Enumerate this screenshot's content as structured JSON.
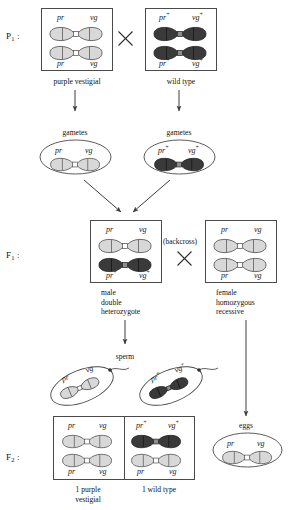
{
  "figure": {
    "colors": {
      "chromosome_recessive": "#d8d8d8",
      "chromosome_wildtype": "#3a3a3a",
      "outline": "#4a4a4a",
      "text": "#111111",
      "background": "#ffffff"
    }
  },
  "generations": {
    "p1_label": "P",
    "p1_sub": "1",
    "p1_colon": " :",
    "f1_label": "F",
    "f1_sub": "1",
    "f1_colon": " :",
    "f2_label": "F",
    "f2_sub": "2",
    "f2_colon": " :"
  },
  "alleles": {
    "pr": "pr",
    "vg": "vg",
    "pr_plus_base": "pr",
    "vg_plus_base": "vg",
    "plus": "+"
  },
  "p1": {
    "parent_left": {
      "caption": "purple vestigial",
      "top_left_allele": "pr",
      "top_right_allele": "vg",
      "bottom_left_allele": "pr",
      "bottom_right_allele": "vg",
      "chromosome_type": "recessive"
    },
    "parent_right": {
      "caption": "wild type",
      "top_left_allele": "pr",
      "top_right_allele": "vg",
      "bottom_left_allele": "pr",
      "bottom_right_allele": "vg",
      "chromosome_type": "wildtype"
    },
    "cross_symbol": "×"
  },
  "gametes": {
    "left_label": "gametes",
    "right_label": "gametes",
    "left_alleles": {
      "left": "pr",
      "right": "vg"
    },
    "right_alleles": {
      "left": "pr",
      "right": "vg"
    }
  },
  "f1": {
    "male": {
      "caption_line1": "male",
      "caption_line2": "double",
      "caption_line3": "heterozygote",
      "top_left_allele": "pr",
      "top_right_allele": "vg",
      "bottom_left_allele": "pr",
      "bottom_right_allele": "vg"
    },
    "female": {
      "caption_line1": "female",
      "caption_line2": "homozygous",
      "caption_line3": "recessive",
      "top_left_allele": "pr",
      "top_right_allele": "vg",
      "bottom_left_allele": "pr",
      "bottom_right_allele": "vg"
    },
    "backcross_label": "(backcross)",
    "cross_symbol": "×"
  },
  "sperm": {
    "label": "sperm",
    "cell_left": {
      "left_allele": "pr",
      "right_allele": "vg"
    },
    "cell_right": {
      "left_allele": "pr",
      "right_allele": "vg"
    }
  },
  "eggs": {
    "label": "eggs",
    "left_allele": "pr",
    "right_allele": "vg"
  },
  "f2": {
    "offspring_left": {
      "caption_line1": "1 purple",
      "caption_line2": "vestigial",
      "top_left_allele": "pr",
      "top_right_allele": "vg",
      "bottom_left_allele": "pr",
      "bottom_right_allele": "vg"
    },
    "offspring_right": {
      "caption_line1": "1 wild type",
      "caption_line2": "",
      "top_left_allele": "pr",
      "top_right_allele": "vg",
      "bottom_left_allele": "pr",
      "bottom_right_allele": "vg"
    }
  }
}
